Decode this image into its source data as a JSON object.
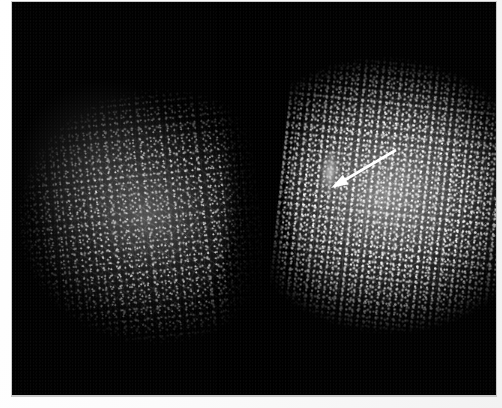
{
  "image": {
    "modality_label": "mammogram",
    "view_label": "bilateral-breast-radiograph",
    "background_color": "#ffffff",
    "film_color": "#010101",
    "film": {
      "x": 12,
      "y": 2,
      "width": 484,
      "height": 393
    }
  },
  "breasts": [
    {
      "side_label": "left-breast",
      "density_label": "lower-density",
      "x": 6,
      "y": 30,
      "width": 244,
      "height": 345
    },
    {
      "side_label": "right-breast",
      "density_label": "higher-density",
      "x": 246,
      "y": 26,
      "width": 250,
      "height": 350
    }
  ],
  "finding": {
    "marker_label": "spiculated-mass",
    "marker_color": "#ffffff",
    "tip_x": 331,
    "tip_y": 188,
    "tail_x": 396,
    "tail_y": 150
  },
  "annotation": {
    "arrow_label": "pointer-arrow",
    "arrow_color": "#ffffff",
    "arrow_head_width": 11,
    "arrow_head_length": 17,
    "arrow_shaft_width": 3
  }
}
